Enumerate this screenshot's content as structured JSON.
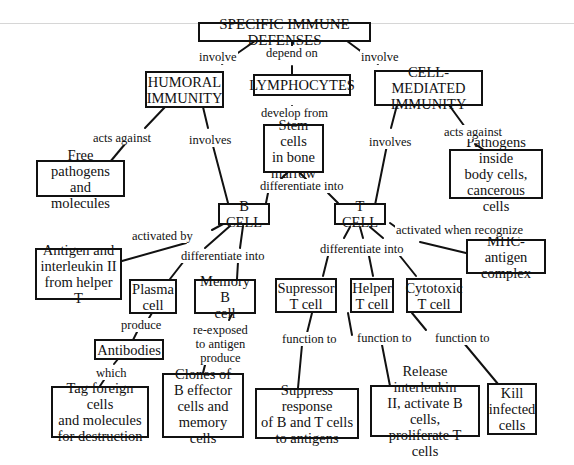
{
  "diagram": {
    "type": "concept-map",
    "nodes": {
      "root": "SPECIFIC IMMUNE DEFENSES",
      "humoral": "HUMORAL\nIMMUNITY",
      "lymphocytes": "LYMPHOCYTES",
      "cell_mediated": "CELL-MEDIATED\nIMMUNITY",
      "stem_cells": "Stem cells\nin bone\nmarrow",
      "free_pathogens": "Free pathogens\nand molecules",
      "pathogens_inside": "Pathogens inside\nbody cells,\ncancerous cells",
      "b_cell": "B CELL",
      "t_cell": "T CELL",
      "antigen_interleukin": "Antigen and\ninterleukin II\nfrom helper T",
      "mhc_antigen": "MHC-antigen\ncomplex",
      "plasma_cell": "Plasma\ncell",
      "memory_b_cell": "Memory B\ncell",
      "supressor_t_cell": "Supressor\nT cell",
      "helper_t_cell": "Helper\nT cell",
      "cytotoxic_t_cell": "Cytotoxic\nT cell",
      "antibodies": "Antibodies",
      "tag_foreign": "Tag foreign cells\nand molecules\nfor destruction",
      "clones": "Clones of\nB effector\ncells and\nmemory cells",
      "suppress_response": "Suppress response\nof B and T cells\nto antigens",
      "release_interleukin": "Release interleukin\nII, activate B cells,\nproliferate T cells",
      "kill_infected": "Kill\ninfected\ncells"
    },
    "links": {
      "root_humoral": "involve",
      "root_lymphocytes": "depend on",
      "root_cell_mediated": "involve",
      "lymphocytes_stem": "develop from",
      "humoral_free": "acts against",
      "humoral_bcell": "involves",
      "cellmed_pathogens": "acts against",
      "cellmed_tcell": "involves",
      "stem_bt": "differentiate into",
      "bcell_antigen": "activated by",
      "bcell_diff": "differentiate into",
      "tcell_mhc": "activated when recognize",
      "tcell_diff": "differentiate into",
      "plasma_antibodies": "produce",
      "memory_clones": "re-exposed\nto antigen\nproduce",
      "antibodies_tag": "which",
      "supressor_fn": "function to",
      "helper_fn": "function to",
      "cytotoxic_fn": "function to"
    }
  }
}
